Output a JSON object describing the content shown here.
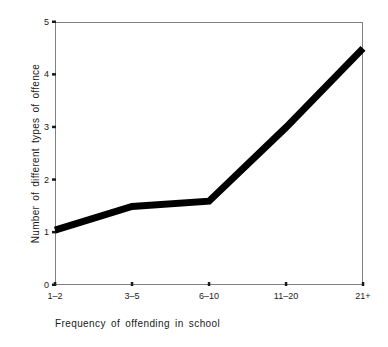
{
  "chart_data": {
    "type": "line",
    "title": "",
    "subtitle": "",
    "xlabel": "Frequency of offending in school",
    "ylabel": "Number of different types of offence",
    "categories": [
      "1–2",
      "3–5",
      "6–10",
      "11–20",
      "21+"
    ],
    "values": [
      1.05,
      1.5,
      1.6,
      3.0,
      4.5
    ],
    "series": [
      {
        "name": "Number of different types of offence",
        "values": [
          1.05,
          1.5,
          1.6,
          3.0,
          4.5
        ]
      }
    ],
    "ylim": [
      0,
      5
    ],
    "yticks": [
      0,
      1,
      2,
      3,
      4,
      5
    ],
    "ytick_labels": [
      "0",
      "1",
      "2",
      "3",
      "4",
      "5"
    ],
    "xtick_labels": [
      "1–2",
      "3–5",
      "6–10",
      "11–20",
      "21+"
    ],
    "grid": false,
    "legend": null,
    "legend_position": "none",
    "line_color": "#000000",
    "line_width_px": 7,
    "frame_color": "#808080",
    "background_color": "#ffffff",
    "annotations": []
  },
  "axes": {
    "y": {
      "ticks": [
        {
          "label": "5",
          "value": 5
        },
        {
          "label": "4",
          "value": 4
        },
        {
          "label": "3",
          "value": 3
        },
        {
          "label": "2",
          "value": 2
        },
        {
          "label": "1",
          "value": 1
        },
        {
          "label": "0",
          "value": 0
        }
      ],
      "title": "Number of different types of offence"
    },
    "x": {
      "ticks": [
        {
          "label": "1–2"
        },
        {
          "label": "3–5"
        },
        {
          "label": "6–10"
        },
        {
          "label": "11–20"
        },
        {
          "label": "21+"
        }
      ],
      "title": "Frequency of offending in school"
    }
  }
}
